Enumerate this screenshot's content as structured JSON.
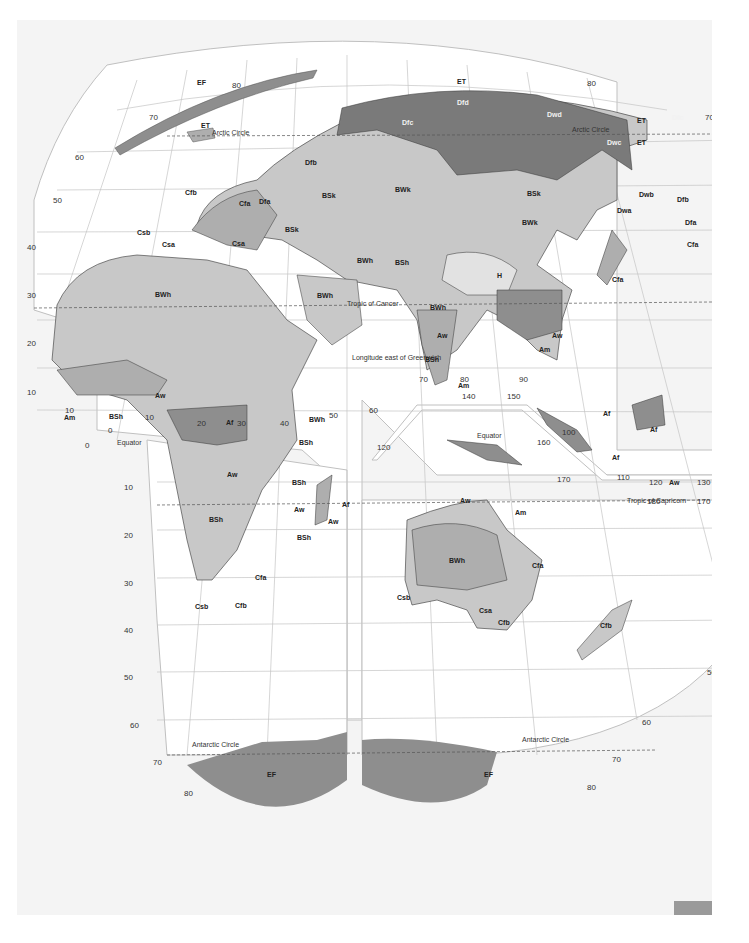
{
  "map": {
    "title": "Köppen climate classification — Eastern Hemisphere (interrupted projection)",
    "colors": {
      "background": "#f4f4f4",
      "ocean": "#ffffff",
      "graticule": "#b8b8b8",
      "light_zone": "#c8c8c8",
      "mid_zone": "#aeaeae",
      "dark_zone": "#8e8e8e",
      "darkest_zone": "#7a7a7a",
      "highland": "#d8d8d8",
      "boundary": "#333333",
      "corner_tab": "#9a9a9a"
    },
    "reference_lines": {
      "arctic_circle": "Arctic Circle",
      "arctic_circle_east": "Arctic Circle",
      "tropic_cancer": "Tropic of Cancer",
      "equator_west": "Equator",
      "equator_east": "Equator",
      "tropic_capricorn": "Tropic of Capricorn",
      "antarctic_circle_west": "Antarctic Circle",
      "antarctic_circle_east": "Antarctic Circle",
      "longitude_note": "Longitude east of Greenwich"
    },
    "latitude_ticks_left": [
      "80",
      "70",
      "60",
      "50",
      "40",
      "30",
      "20",
      "10",
      "0",
      "10",
      "20",
      "30",
      "40",
      "50",
      "60",
      "70",
      "80"
    ],
    "latitude_ticks_right": [
      "80",
      "70",
      "60",
      "50",
      "40",
      "30",
      "20",
      "10",
      "0",
      "10",
      "20",
      "30",
      "40",
      "50",
      "60",
      "70",
      "80"
    ],
    "longitude_ticks": [
      "10",
      "0",
      "10",
      "20",
      "30",
      "40",
      "50",
      "60",
      "70",
      "80",
      "90",
      "100",
      "110",
      "120",
      "130",
      "140",
      "150",
      "160",
      "170",
      "180",
      "170",
      "120"
    ],
    "climate_labels": {
      "greenland": "EF",
      "iceland": "ET",
      "siberia_n": "ET",
      "siberia_ne": "ET",
      "kamchatka": "ET",
      "dfd": "Dfd",
      "dwd": "Dwd",
      "dfc_w": "Dfc",
      "dfc_e": "Dfc",
      "dwc": "Dwc",
      "dfb": "Dfb",
      "dfb_japan": "Dfb",
      "dfa_japan": "Dfa",
      "dwb": "Dwb",
      "dwa": "Dwa",
      "dfa_balkan": "Dfa",
      "cfb_europe": "Cfb",
      "cfa_balkan": "Cfa",
      "csb_iberia": "Csb",
      "csa_iberia": "Csa",
      "csa_italy": "Csa",
      "bsk_ukraine": "BSk",
      "bsk_turkey": "BSk",
      "bsk_mongolia": "BSk",
      "bwk_central_asia": "BWk",
      "bwk_china": "BWk",
      "bwh_sahara": "BWh",
      "bwh_arabia": "BWh",
      "bwh_iran": "BWh",
      "bwh_thar": "BWh",
      "bwh_somalia": "BWh",
      "bwh_australia": "BWh",
      "bsh_afghanistan": "BSh",
      "bsh_sahel": "BSh",
      "bsh_india": "BSh",
      "bsh_east_africa": "BSh",
      "bsh_south_africa": "BSh",
      "bsh_madagascar": "BSh",
      "bsh_mozambique": "BSh",
      "h_tibet": "H",
      "cfa_china": "Cfa",
      "cfa_japan": "Cfa",
      "aw_india": "Aw",
      "aw_indochina": "Aw",
      "aw_west_africa": "Aw",
      "aw_south_africa": "Aw",
      "aw_mozambique": "Aw",
      "aw_madagascar": "Aw",
      "aw_australia": "Aw",
      "aw_indonesia": "Aw",
      "am_india": "Am",
      "am_burma": "Am",
      "am_west_africa": "Am",
      "am_australia": "Am",
      "af_congo": "Af",
      "af_madagascar": "Af",
      "af_malaya": "Af",
      "af_borneo": "Af",
      "af_sumatra": "Af",
      "cfa_south_africa": "Cfa",
      "cfb_south_africa": "Cfb",
      "csb_south_africa": "Csb",
      "cfa_australia": "Cfa",
      "csb_australia": "Csb",
      "csa_australia": "Csa",
      "cfb_australia": "Cfb",
      "cfb_new_zealand": "Cfb",
      "ef_antarctica_w": "EF",
      "ef_antarctica_e": "EF"
    }
  }
}
